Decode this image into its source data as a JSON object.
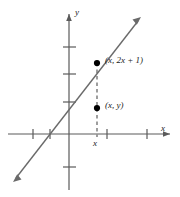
{
  "figure": {
    "type": "cartesian-graph",
    "width": 180,
    "height": 197,
    "background": "#ffffff",
    "ink_color": "#5a5a5a",
    "text_color": "#1a1a1a",
    "dot_color": "#000000"
  },
  "axes": {
    "x_label": "x",
    "y_label": "y",
    "origin_px": {
      "x": 69,
      "y": 134
    },
    "x_ticks_px": [
      33,
      50,
      107,
      147
    ],
    "y_ticks_px": [
      47,
      74,
      102,
      167
    ],
    "arrow_heads": [
      "x-positive",
      "y-positive"
    ]
  },
  "line": {
    "equation": "y = 2x + 1",
    "slope": 2,
    "intercept": 1,
    "arrow_start_px": {
      "x": 13,
      "y": 181
    },
    "arrow_end_px": {
      "x": 141,
      "y": 18
    },
    "double_arrow": true
  },
  "points": [
    {
      "id": "point-on-line",
      "label": "(x, 2x + 1)",
      "label_parts": {
        "open": "(",
        "var1": "x",
        "sep": ", ",
        "coef": "2",
        "var2": "x",
        "plus": " + ",
        "const": "1",
        "close": ")"
      },
      "px": {
        "x": 97,
        "y": 63
      }
    },
    {
      "id": "point-below",
      "label": "(x, y)",
      "label_parts": {
        "open": "(",
        "var1": "x",
        "sep": ", ",
        "var2": "y",
        "close": ")"
      },
      "px": {
        "x": 97,
        "y": 108
      }
    }
  ],
  "dashed_segment": {
    "from_px": {
      "x": 97,
      "y": 63
    },
    "to_px": {
      "x": 97,
      "y": 134
    },
    "style": "dashed",
    "tick_label": "x"
  },
  "labels": {
    "point_upper": "(x, 2x + 1)",
    "point_lower": "(x, y)",
    "axis_x": "x",
    "axis_y": "y",
    "x_value": "x"
  }
}
